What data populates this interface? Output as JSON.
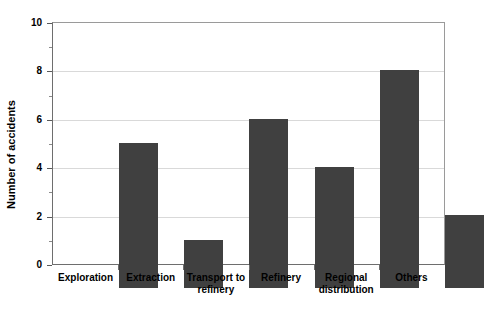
{
  "chart_data": {
    "type": "bar",
    "title": "",
    "xlabel": "",
    "ylabel": "Number of accidents",
    "categories": [
      "Exploration",
      "Extraction",
      "Transport to\nrefinery",
      "Refinery",
      "Regional\ndistribution",
      "Others"
    ],
    "values": [
      6,
      2,
      7,
      5,
      9,
      3
    ],
    "ylim": [
      0,
      10
    ],
    "ytick_labels": [
      "0",
      "2",
      "4",
      "6",
      "8",
      "10"
    ],
    "ytick_values": [
      0,
      2,
      4,
      6,
      8,
      10
    ],
    "yminor_tick_values": [
      1,
      3,
      5,
      7,
      9
    ],
    "grid": "horizontal",
    "legend": "none",
    "colors": {
      "bar": "#404040",
      "gridline": "#d9d9d9",
      "axis": "#6e6e6e",
      "frame": "#9a9a9a",
      "text": "#000000",
      "background": "#ffffff"
    }
  }
}
